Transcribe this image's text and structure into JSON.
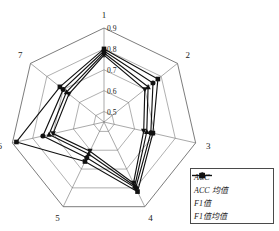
{
  "chart_data": {
    "type": "radar",
    "title": "",
    "xlabel": "",
    "ylabel": "",
    "categories": [
      "1",
      "2",
      "3",
      "4",
      "5",
      "6",
      "7"
    ],
    "radial_ticks": [
      "0.9",
      "0.8",
      "0.7",
      "0.6",
      "0.5"
    ],
    "rlim": [
      0.45,
      0.9
    ],
    "grid": true,
    "legend_position": "bottom-right",
    "series": [
      {
        "name": "ACC",
        "marker": "square",
        "values": [
          0.8,
          0.78,
          0.69,
          0.82,
          0.66,
          0.88,
          0.72
        ]
      },
      {
        "name": "ACC 均值",
        "marker": "circle",
        "values": [
          0.79,
          0.75,
          0.68,
          0.8,
          0.64,
          0.75,
          0.7
        ]
      },
      {
        "name": "F1值",
        "marker": "triangle-up",
        "values": [
          0.78,
          0.72,
          0.66,
          0.79,
          0.62,
          0.72,
          0.68
        ]
      },
      {
        "name": "F1值均值",
        "marker": "triangle-down",
        "values": [
          0.77,
          0.7,
          0.645,
          0.775,
          0.605,
          0.7,
          0.665
        ]
      }
    ]
  },
  "legend": {
    "items": [
      {
        "label": "ACC",
        "marker": "square-marker-icon"
      },
      {
        "label": "ACC 均值",
        "marker": "circle-marker-icon"
      },
      {
        "label": "F1值",
        "marker": "triangle-up-marker-icon"
      },
      {
        "label": "F1值均值",
        "marker": "triangle-down-marker-icon"
      }
    ]
  },
  "colors": {
    "line": "#111111",
    "grid": "#7a7a7a",
    "text": "#1a1a1a"
  }
}
